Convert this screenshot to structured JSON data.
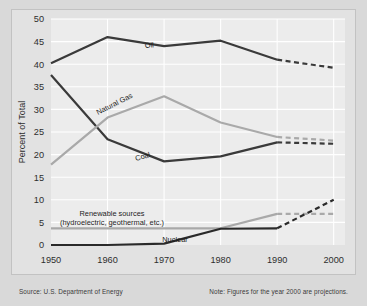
{
  "chart_data": {
    "type": "line",
    "title": "",
    "xlabel": "",
    "ylabel": "Percent of Total",
    "x": [
      1950,
      1960,
      1970,
      1980,
      1990,
      2000
    ],
    "xticklabels": [
      "1950",
      "1960",
      "1970",
      "1980",
      "1990",
      "2000"
    ],
    "xlim": [
      1950,
      2002
    ],
    "ylim": [
      0,
      50
    ],
    "yticks": [
      0,
      5,
      10,
      15,
      20,
      25,
      30,
      35,
      40,
      45,
      50
    ],
    "yticklabels": [
      "0",
      "5",
      "10",
      "15",
      "20",
      "25",
      "30",
      "35",
      "40",
      "45",
      "50"
    ],
    "grid": true,
    "legend_position": "inline-labels",
    "projection_start_year": 1990,
    "series": [
      {
        "name": "Oil",
        "label": "Oil",
        "color": "#3a3a3a",
        "values": [
          40.2,
          46.0,
          44.0,
          45.2,
          41.0,
          39.2
        ],
        "actual_values": [
          40.2,
          46.0,
          44.0,
          45.2,
          41.0
        ],
        "projected_values": [
          41.0,
          39.2
        ]
      },
      {
        "name": "Coal",
        "label": "Coal",
        "color": "#3a3a3a",
        "values": [
          37.6,
          23.4,
          18.5,
          19.6,
          22.7,
          22.4
        ],
        "actual_values": [
          37.6,
          23.4,
          18.5,
          19.6,
          22.7
        ],
        "projected_values": [
          22.7,
          22.4
        ]
      },
      {
        "name": "Natural Gas",
        "label": "Natural Gas",
        "color": "#a9a9a9",
        "values": [
          17.8,
          28.2,
          32.9,
          27.1,
          23.9,
          23.1
        ],
        "actual_values": [
          17.8,
          28.2,
          32.9,
          27.1,
          23.9
        ],
        "projected_values": [
          23.9,
          23.1
        ]
      },
      {
        "name": "Renewable sources",
        "label": "Renewable sources",
        "sublabel": "(hydroelectric, geothermal, etc.)",
        "color": "#a9a9a9",
        "values": [
          3.7,
          3.7,
          3.7,
          3.7,
          6.9,
          6.9
        ],
        "actual_values": [
          3.7,
          3.7,
          3.7,
          3.7,
          6.9
        ],
        "projected_values": [
          6.9,
          6.9
        ]
      },
      {
        "name": "Nuclear",
        "label": "Nuclear",
        "color": "#2a2a2a",
        "values": [
          0.0,
          0.0,
          0.3,
          3.6,
          3.7,
          10.0
        ],
        "actual_values": [
          0.0,
          0.0,
          0.3,
          3.6,
          3.7
        ],
        "projected_values": [
          3.7,
          10.0
        ]
      }
    ]
  },
  "footer": {
    "source": "Source: U.S. Department of Energy",
    "note": "Note: Figures for the year 2000 are projections."
  }
}
